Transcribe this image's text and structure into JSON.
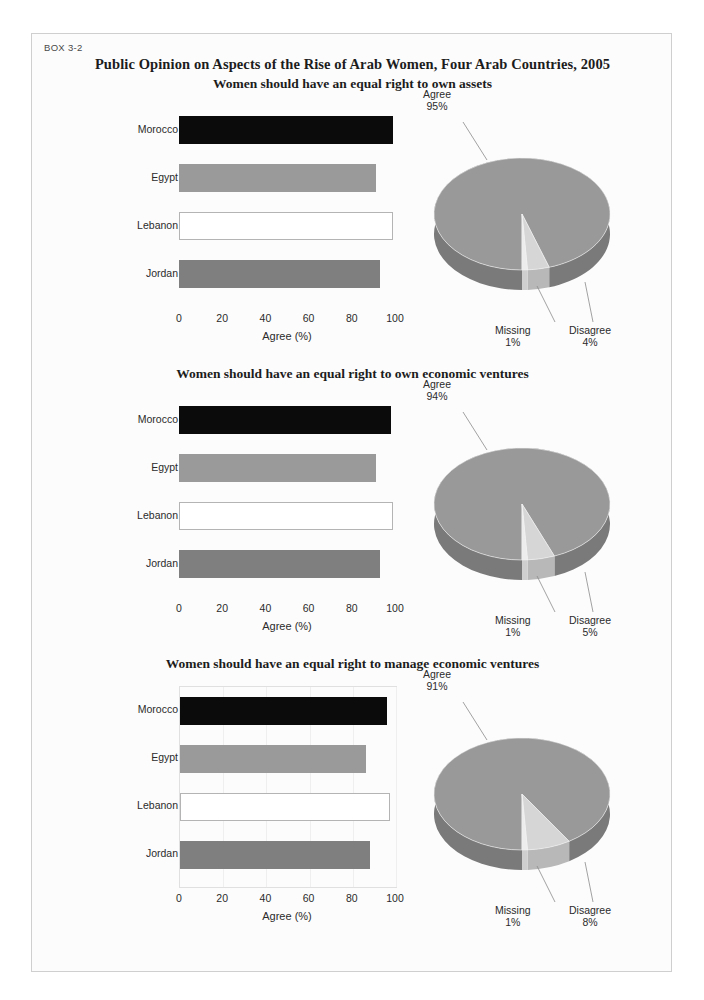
{
  "box_label": "BOX 3-2",
  "main_title": "Public Opinion on Aspects of the Rise of Arab Women, Four Arab Countries, 2005",
  "axis": {
    "xlabel": "Agree (%)",
    "ticks": [
      "0",
      "20",
      "40",
      "60",
      "80",
      "100"
    ],
    "xmin": 0,
    "xmax": 100
  },
  "colors": {
    "morocco": "#0b0b0b",
    "egypt": "#9a9a9a",
    "lebanon": "#ffffff",
    "jordan": "#7f7f7f",
    "pie_agree": "#999999",
    "pie_disagree": "#d6d6d6",
    "pie_missing": "#ededed",
    "pie_rim": "#7a7a7a",
    "page_border": "#cfcfcf"
  },
  "sections": [
    {
      "title": "Women should have an equal right to own assets",
      "bar": {
        "type": "bar",
        "orientation": "horizontal",
        "categories": [
          "Morocco",
          "Egypt",
          "Lebanon",
          "Jordan"
        ],
        "values": [
          99,
          91,
          99,
          93
        ],
        "xlabel": "Agree (%)",
        "ylabel": "",
        "xlim": [
          0,
          100
        ],
        "grid": false,
        "plot_border": false
      },
      "pie": {
        "type": "pie",
        "labels": [
          "Agree",
          "Disagree",
          "Missing"
        ],
        "values": [
          95,
          4,
          1
        ],
        "value_labels": [
          "95%",
          "4%",
          "1%"
        ],
        "legend": "callout-labels"
      }
    },
    {
      "title": "Women should have an equal right to own economic ventures",
      "bar": {
        "type": "bar",
        "orientation": "horizontal",
        "categories": [
          "Morocco",
          "Egypt",
          "Lebanon",
          "Jordan"
        ],
        "values": [
          98,
          91,
          99,
          93
        ],
        "xlabel": "Agree (%)",
        "ylabel": "",
        "xlim": [
          0,
          100
        ],
        "grid": false,
        "plot_border": false
      },
      "pie": {
        "type": "pie",
        "labels": [
          "Agree",
          "Disagree",
          "Missing"
        ],
        "values": [
          94,
          5,
          1
        ],
        "value_labels": [
          "94%",
          "5%",
          "1%"
        ],
        "legend": "callout-labels"
      }
    },
    {
      "title": "Women should have an equal right to manage economic ventures",
      "bar": {
        "type": "bar",
        "orientation": "horizontal",
        "categories": [
          "Morocco",
          "Egypt",
          "Lebanon",
          "Jordan"
        ],
        "values": [
          96,
          86,
          97,
          88
        ],
        "xlabel": "Agree (%)",
        "ylabel": "",
        "xlim": [
          0,
          100
        ],
        "grid": true,
        "plot_border": true
      },
      "pie": {
        "type": "pie",
        "labels": [
          "Agree",
          "Disagree",
          "Missing"
        ],
        "values": [
          91,
          8,
          1
        ],
        "value_labels": [
          "91%",
          "8%",
          "1%"
        ],
        "legend": "callout-labels"
      }
    }
  ],
  "chart_data": [
    {
      "type": "bar",
      "title": "Women should have an equal right to own assets",
      "categories": [
        "Morocco",
        "Egypt",
        "Lebanon",
        "Jordan"
      ],
      "values": [
        99,
        91,
        99,
        93
      ],
      "xlabel": "Agree (%)",
      "ylabel": "",
      "xlim": [
        0,
        100
      ]
    },
    {
      "type": "pie",
      "title": "Women should have an equal right to own assets",
      "categories": [
        "Agree",
        "Disagree",
        "Missing"
      ],
      "values": [
        95,
        4,
        1
      ]
    },
    {
      "type": "bar",
      "title": "Women should have an equal right to own economic ventures",
      "categories": [
        "Morocco",
        "Egypt",
        "Lebanon",
        "Jordan"
      ],
      "values": [
        98,
        91,
        99,
        93
      ],
      "xlabel": "Agree (%)",
      "ylabel": "",
      "xlim": [
        0,
        100
      ]
    },
    {
      "type": "pie",
      "title": "Women should have an equal right to own economic ventures",
      "categories": [
        "Agree",
        "Disagree",
        "Missing"
      ],
      "values": [
        94,
        5,
        1
      ]
    },
    {
      "type": "bar",
      "title": "Women should have an equal right to manage economic ventures",
      "categories": [
        "Morocco",
        "Egypt",
        "Lebanon",
        "Jordan"
      ],
      "values": [
        96,
        86,
        97,
        88
      ],
      "xlabel": "Agree (%)",
      "ylabel": "",
      "xlim": [
        0,
        100
      ]
    },
    {
      "type": "pie",
      "title": "Women should have an equal right to manage economic ventures",
      "categories": [
        "Agree",
        "Disagree",
        "Missing"
      ],
      "values": [
        91,
        8,
        1
      ]
    }
  ]
}
